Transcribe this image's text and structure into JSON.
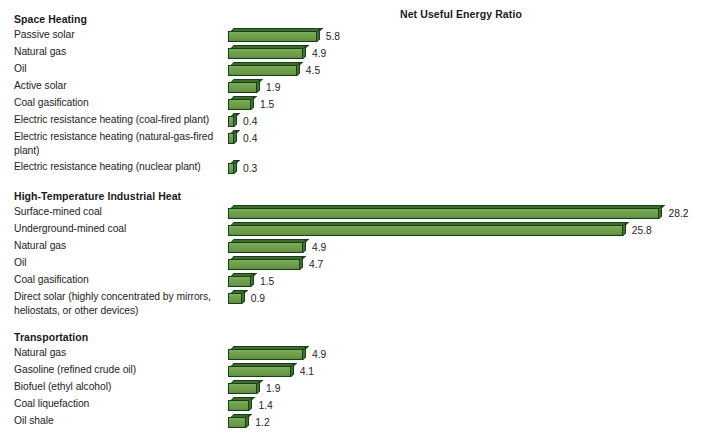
{
  "chart_data": {
    "type": "bar",
    "orientation": "horizontal",
    "title": "Net Useful Energy Ratio",
    "xlabel": "",
    "ylabel": "",
    "grid": false,
    "legend": false,
    "value_labels": true,
    "xlim": [
      0,
      30
    ],
    "sections": [
      {
        "name": "Space Heating",
        "categories": [
          "Passive solar",
          "Natural gas",
          "Oil",
          "Active solar",
          "Coal gasification",
          "Electric resistance heating (coal-fired plant)",
          "Electric resistance heating (natural-gas-fired plant)",
          "Electric resistance heating (nuclear plant)"
        ],
        "values": [
          5.8,
          4.9,
          4.5,
          1.9,
          1.5,
          0.4,
          0.4,
          0.3
        ],
        "value_labels": [
          "5.8",
          "4.9",
          "4.5",
          "1.9",
          "1.5",
          "0.4",
          "0.4",
          "0.3"
        ]
      },
      {
        "name": "High-Temperature Industrial Heat",
        "categories": [
          "Surface-mined coal",
          "Underground-mined coal",
          "Natural gas",
          "Oil",
          "Coal gasification",
          "Direct solar (highly concentrated by mirrors, heliostats, or other devices)"
        ],
        "values": [
          28.2,
          25.8,
          4.9,
          4.7,
          1.5,
          0.9
        ],
        "value_labels": [
          "28.2",
          "25.8",
          "4.9",
          "4.7",
          "1.5",
          "0.9"
        ]
      },
      {
        "name": "Transportation",
        "categories": [
          "Natural gas",
          "Gasoline (refined crude oil)",
          "Biofuel (ethyl alcohol)",
          "Coal liquefaction",
          "Oil shale"
        ],
        "values": [
          4.9,
          4.1,
          1.9,
          1.4,
          1.2
        ],
        "value_labels": [
          "4.9",
          "4.1",
          "1.9",
          "1.4",
          "1.2"
        ]
      }
    ],
    "colors": {
      "bar_face": "#6f9f4b",
      "bar_shadow": "#43702e",
      "bar_outline": "#15401a",
      "background": "#ffffff",
      "text": "#1d1d1d"
    }
  }
}
